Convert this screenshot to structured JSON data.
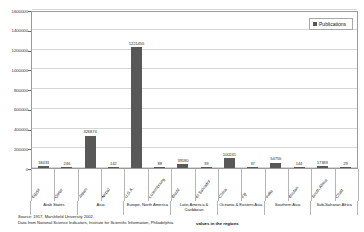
{
  "top_strip": {
    "fragments": [
      "···",
      "··",
      "··",
      "··",
      "··",
      "··"
    ]
  },
  "legend": {
    "label": "Publications",
    "swatch_color": "#585858"
  },
  "footer": {
    "source_line1": "Source: 1917, Marshfield University 2002.",
    "source_line2": "Data from National Science Indicators, Institute for Scientific Information, Philadelphia.",
    "region_note": "values in the regions"
  },
  "chart_data": {
    "type": "bar",
    "title": "",
    "xlabel": "",
    "ylabel": "publications per year, average 1996-2000",
    "ylim": [
      0,
      1600000
    ],
    "ytick_values": [
      0,
      200000,
      400000,
      600000,
      800000,
      1000000,
      1200000,
      1400000,
      1600000
    ],
    "ytick_labels": [
      "0",
      "200000",
      "400000",
      "600000",
      "800000",
      "1000000",
      "1200000",
      "1400000",
      "1600000"
    ],
    "grid": true,
    "legend_position": "top-right",
    "bar_color": "#585858",
    "series": [
      {
        "name": "Publications",
        "values": [
          18433,
          246,
          326874,
          142,
          1221455,
          88,
          39180,
          39,
          100241,
          37,
          54755,
          144,
          17383,
          29
        ]
      }
    ],
    "categories": [
      "Egypt",
      "Qatar",
      "Japan",
      "Nepal",
      "U.S.A.",
      "Luxembourg",
      "Brazil",
      "El Salvador",
      "China",
      "Fiji",
      "India",
      "Bhutan",
      "South Africa",
      "Chad"
    ],
    "data_labels": [
      "18433",
      "246",
      "326874",
      "142",
      "1221455",
      "88",
      "39180",
      "39",
      "100241",
      "37",
      "54755",
      "144",
      "17383",
      "29"
    ],
    "region_groups": [
      {
        "label": "Arab States",
        "span": 2
      },
      {
        "label": "Asia",
        "span": 2
      },
      {
        "label": "Europe, North America",
        "span": 2
      },
      {
        "label": "Latin America &\nCaribbean",
        "span": 2
      },
      {
        "label": "Oceania & Eastern Asia",
        "span": 2
      },
      {
        "label": "Southern Asia",
        "span": 2
      },
      {
        "label": "Sub-Saharan Africa",
        "span": 2
      }
    ]
  }
}
